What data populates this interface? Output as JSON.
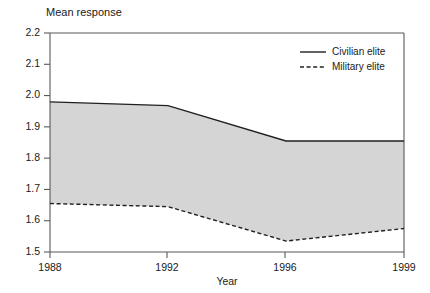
{
  "chart_data": {
    "type": "line",
    "title": "Mean response",
    "xlabel": "Year",
    "ylabel": "",
    "categories": [
      "1988",
      "1992",
      "1996",
      "1999"
    ],
    "x": [
      1988,
      1992,
      1996,
      1999
    ],
    "series": [
      {
        "name": "Civilian elite",
        "style": "solid",
        "values": [
          1.98,
          1.968,
          1.855,
          1.855
        ]
      },
      {
        "name": "Military elite",
        "style": "dashed",
        "values": [
          1.655,
          1.645,
          1.535,
          1.575
        ]
      }
    ],
    "ylim": [
      1.5,
      2.2
    ],
    "yticks": [
      "1.5",
      "1.6",
      "1.7",
      "1.8",
      "1.9",
      "2.0",
      "2.1",
      "2.2"
    ],
    "ytick_values": [
      1.5,
      1.6,
      1.7,
      1.8,
      1.9,
      2.0,
      2.1,
      2.2
    ],
    "xticks": [
      "1988",
      "1992",
      "1996",
      "1999"
    ],
    "grid": false,
    "legend_position": "top-right",
    "band_fill": "#d5d5d5",
    "line_color": "#231f20",
    "axis_color": "#58595b",
    "band_note": "shaded area between Civilian elite and Military elite series"
  },
  "legend": {
    "items": [
      {
        "label": "Civilian elite",
        "style": "solid"
      },
      {
        "label": "Military elite",
        "style": "dashed"
      }
    ]
  },
  "axes": {
    "y_labels": [
      "2.2",
      "2.1",
      "2.0",
      "1.9",
      "1.8",
      "1.7",
      "1.6",
      "1.5"
    ],
    "x_labels": [
      "1988",
      "1992",
      "1996",
      "1999"
    ],
    "x_title": "Year"
  },
  "title": "Mean response"
}
